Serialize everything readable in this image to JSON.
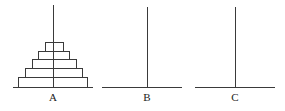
{
  "colors": {
    "stroke": "#3a3a3a",
    "background": "#ffffff",
    "text": "#222222"
  },
  "pegs": [
    {
      "label": "A",
      "x": 53,
      "base_x1": 13,
      "base_x2": 93,
      "top_y": 5
    },
    {
      "label": "B",
      "x": 147,
      "base_x1": 102,
      "base_x2": 182,
      "top_y": 7
    },
    {
      "label": "C",
      "x": 235,
      "base_x1": 195,
      "base_x2": 275,
      "top_y": 7
    }
  ],
  "base_y": 87,
  "label_y": 101,
  "disks": [
    {
      "peg": "A",
      "x1": 45,
      "x2": 63,
      "y1": 42,
      "y2": 51
    },
    {
      "peg": "A",
      "x1": 38,
      "x2": 69,
      "y1": 51,
      "y2": 59
    },
    {
      "peg": "A",
      "x1": 32,
      "x2": 76,
      "y1": 59,
      "y2": 68
    },
    {
      "peg": "A",
      "x1": 25,
      "x2": 82,
      "y1": 68,
      "y2": 77
    },
    {
      "peg": "A",
      "x1": 18,
      "x2": 87,
      "y1": 77,
      "y2": 87
    }
  ]
}
